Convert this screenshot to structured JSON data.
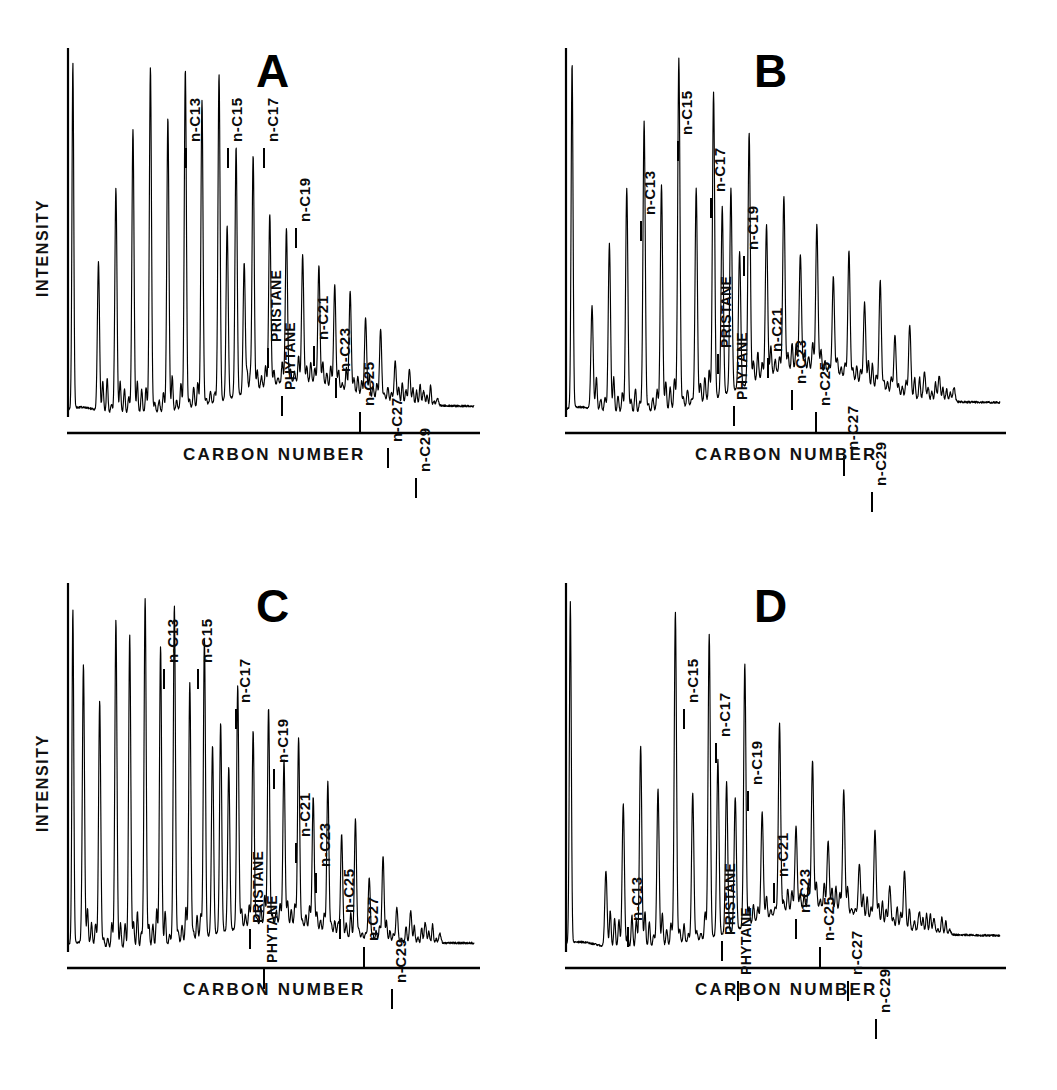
{
  "figure": {
    "axis_labels": {
      "x": "CARBON NUMBER",
      "y": "INTENSITY"
    },
    "ink_color": "#000000",
    "background_color": "#ffffff"
  },
  "panels": [
    {
      "id": "A",
      "letter": "A",
      "show_ylabel": true,
      "ylabel": "INTENSITY",
      "xlabel": "CARBON NUMBER",
      "labels": [
        {
          "text": "n-C13",
          "x": 118,
          "y": 32
        },
        {
          "text": "n-C15",
          "x": 160,
          "y": 32
        },
        {
          "text": "n-C17",
          "x": 196,
          "y": 32
        },
        {
          "text": "n-C19",
          "x": 228,
          "y": 112
        },
        {
          "text": "PRISTANE",
          "x": 200,
          "y": 232
        },
        {
          "text": "PHYTANE",
          "x": 214,
          "y": 280
        },
        {
          "text": "n-C21",
          "x": 246,
          "y": 230
        },
        {
          "text": "n-C23",
          "x": 268,
          "y": 262
        },
        {
          "text": "n-C25",
          "x": 292,
          "y": 296
        },
        {
          "text": "n-C27",
          "x": 320,
          "y": 332
        },
        {
          "text": "n-C29",
          "x": 348,
          "y": 362
        }
      ],
      "chart_data": {
        "type": "line",
        "title": "A",
        "xlabel": "CARBON NUMBER",
        "ylabel": "INTENSITY",
        "ylim": [
          0,
          100
        ],
        "ucm_hump": {
          "center": 0.56,
          "width": 0.3,
          "height": 7.5,
          "tail": 2.0
        },
        "solvent_peak": {
          "x": 0.012,
          "height": 96
        },
        "alkane_series": [
          {
            "name": "n-C10",
            "x": 0.075,
            "height": 42
          },
          {
            "name": "n-C11",
            "x": 0.118,
            "height": 62
          },
          {
            "name": "n-C12",
            "x": 0.16,
            "height": 78
          },
          {
            "name": "n-C13",
            "x": 0.203,
            "height": 95
          },
          {
            "name": "n-C14",
            "x": 0.246,
            "height": 81
          },
          {
            "name": "n-C15",
            "x": 0.289,
            "height": 94
          },
          {
            "name": "n-C16",
            "x": 0.33,
            "height": 86
          },
          {
            "name": "n-C17",
            "x": 0.372,
            "height": 93
          },
          {
            "name": "PRISTANE",
            "x": 0.392,
            "height": 52
          },
          {
            "name": "n-C18",
            "x": 0.414,
            "height": 73
          },
          {
            "name": "PHYTANE",
            "x": 0.434,
            "height": 42
          },
          {
            "name": "n-C19",
            "x": 0.456,
            "height": 71
          },
          {
            "name": "n-C20",
            "x": 0.497,
            "height": 55
          },
          {
            "name": "n-C21",
            "x": 0.538,
            "height": 51
          },
          {
            "name": "n-C22",
            "x": 0.578,
            "height": 44
          },
          {
            "name": "n-C23",
            "x": 0.618,
            "height": 41
          },
          {
            "name": "n-C24",
            "x": 0.657,
            "height": 36
          },
          {
            "name": "n-C25",
            "x": 0.695,
            "height": 34
          },
          {
            "name": "n-C26",
            "x": 0.733,
            "height": 27
          },
          {
            "name": "n-C27",
            "x": 0.77,
            "height": 24
          },
          {
            "name": "n-C28",
            "x": 0.806,
            "height": 15
          },
          {
            "name": "n-C29",
            "x": 0.841,
            "height": 13
          },
          {
            "name": "n-C30",
            "x": 0.876,
            "height": 7
          },
          {
            "name": "n-C31",
            "x": 0.91,
            "height": 5
          }
        ]
      }
    },
    {
      "id": "B",
      "letter": "B",
      "show_ylabel": false,
      "ylabel": "",
      "xlabel": "CARBON NUMBER",
      "labels": [
        {
          "text": "n-C13",
          "x": 75,
          "y": 105
        },
        {
          "text": "n-C15",
          "x": 112,
          "y": 25
        },
        {
          "text": "n-C17",
          "x": 145,
          "y": 82
        },
        {
          "text": "n-C19",
          "x": 178,
          "y": 140
        },
        {
          "text": "PRISTANE",
          "x": 152,
          "y": 238
        },
        {
          "text": "PHYTANE",
          "x": 168,
          "y": 290
        },
        {
          "text": "n-C21",
          "x": 202,
          "y": 242
        },
        {
          "text": "n-C23",
          "x": 226,
          "y": 274
        },
        {
          "text": "n-C25",
          "x": 250,
          "y": 296
        },
        {
          "text": "n-C27",
          "x": 278,
          "y": 340
        },
        {
          "text": "n-C29",
          "x": 306,
          "y": 376
        }
      ],
      "chart_data": {
        "type": "line",
        "title": "B",
        "xlabel": "CARBON NUMBER",
        "ylabel": "INTENSITY",
        "ylim": [
          0,
          100
        ],
        "ucm_hump": {
          "center": 0.54,
          "width": 0.3,
          "height": 10.5,
          "tail": 3.0
        },
        "solvent_peak": {
          "x": 0.014,
          "height": 96
        },
        "alkane_series": [
          {
            "name": "n-C10",
            "x": 0.06,
            "height": 30
          },
          {
            "name": "n-C11",
            "x": 0.1,
            "height": 47
          },
          {
            "name": "n-C12",
            "x": 0.14,
            "height": 62
          },
          {
            "name": "n-C13",
            "x": 0.18,
            "height": 80
          },
          {
            "name": "n-C14",
            "x": 0.22,
            "height": 63
          },
          {
            "name": "n-C15",
            "x": 0.26,
            "height": 97
          },
          {
            "name": "n-C16",
            "x": 0.3,
            "height": 62
          },
          {
            "name": "n-C17",
            "x": 0.34,
            "height": 88
          },
          {
            "name": "PRISTANE",
            "x": 0.36,
            "height": 57
          },
          {
            "name": "n-C18",
            "x": 0.38,
            "height": 62
          },
          {
            "name": "PHYTANE",
            "x": 0.4,
            "height": 45
          },
          {
            "name": "n-C19",
            "x": 0.422,
            "height": 77
          },
          {
            "name": "n-C20",
            "x": 0.462,
            "height": 52
          },
          {
            "name": "n-C21",
            "x": 0.502,
            "height": 60
          },
          {
            "name": "n-C22",
            "x": 0.54,
            "height": 44
          },
          {
            "name": "n-C23",
            "x": 0.578,
            "height": 52
          },
          {
            "name": "n-C24",
            "x": 0.616,
            "height": 38
          },
          {
            "name": "n-C25",
            "x": 0.652,
            "height": 45
          },
          {
            "name": "n-C26",
            "x": 0.688,
            "height": 31
          },
          {
            "name": "n-C27",
            "x": 0.724,
            "height": 37
          },
          {
            "name": "n-C28",
            "x": 0.758,
            "height": 22
          },
          {
            "name": "n-C29",
            "x": 0.792,
            "height": 25
          },
          {
            "name": "n-C30",
            "x": 0.826,
            "height": 12
          },
          {
            "name": "n-C31",
            "x": 0.86,
            "height": 11
          },
          {
            "name": "n-C32",
            "x": 0.894,
            "height": 8
          }
        ]
      }
    },
    {
      "id": "C",
      "letter": "C",
      "show_ylabel": true,
      "ylabel": "INTENSITY",
      "xlabel": "CARBON NUMBER",
      "labels": [
        {
          "text": "n-C13",
          "x": 96,
          "y": 18
        },
        {
          "text": "n-C15",
          "x": 130,
          "y": 18
        },
        {
          "text": "n-C17",
          "x": 168,
          "y": 58
        },
        {
          "text": "n-C19",
          "x": 206,
          "y": 118
        },
        {
          "text": "PRISTANE",
          "x": 182,
          "y": 278
        },
        {
          "text": "PHYTANE",
          "x": 196,
          "y": 318
        },
        {
          "text": "n-C21",
          "x": 228,
          "y": 192
        },
        {
          "text": "n-C23",
          "x": 248,
          "y": 222
        },
        {
          "text": "n-C25",
          "x": 272,
          "y": 268
        },
        {
          "text": "n-C27",
          "x": 296,
          "y": 296
        },
        {
          "text": "n-C29",
          "x": 324,
          "y": 338
        }
      ],
      "chart_data": {
        "type": "line",
        "title": "C",
        "xlabel": "CARBON NUMBER",
        "ylabel": "INTENSITY",
        "ylim": [
          0,
          100
        ],
        "ucm_hump": {
          "center": 0.5,
          "width": 0.3,
          "height": 6.0,
          "tail": 1.5
        },
        "solvent_peak": {
          "x": 0.012,
          "height": 93
        },
        "alkane_series": [
          {
            "name": "n-C9",
            "x": 0.038,
            "height": 78
          },
          {
            "name": "n-C10",
            "x": 0.078,
            "height": 68
          },
          {
            "name": "n-C11",
            "x": 0.118,
            "height": 90
          },
          {
            "name": "n-C12",
            "x": 0.152,
            "height": 86
          },
          {
            "name": "n-C13",
            "x": 0.19,
            "height": 96
          },
          {
            "name": "n-C14",
            "x": 0.228,
            "height": 83
          },
          {
            "name": "n-C15",
            "x": 0.262,
            "height": 94
          },
          {
            "name": "n-C16",
            "x": 0.3,
            "height": 73
          },
          {
            "name": "n-C17",
            "x": 0.336,
            "height": 85
          },
          {
            "name": "PRISTANE",
            "x": 0.356,
            "height": 56
          },
          {
            "name": "n-C18",
            "x": 0.376,
            "height": 62
          },
          {
            "name": "PHYTANE",
            "x": 0.396,
            "height": 50
          },
          {
            "name": "n-C19",
            "x": 0.418,
            "height": 72
          },
          {
            "name": "n-C20",
            "x": 0.456,
            "height": 60
          },
          {
            "name": "n-C21",
            "x": 0.494,
            "height": 66
          },
          {
            "name": "n-C22",
            "x": 0.532,
            "height": 52
          },
          {
            "name": "n-C23",
            "x": 0.568,
            "height": 58
          },
          {
            "name": "n-C24",
            "x": 0.604,
            "height": 42
          },
          {
            "name": "n-C25",
            "x": 0.64,
            "height": 46
          },
          {
            "name": "n-C26",
            "x": 0.674,
            "height": 32
          },
          {
            "name": "n-C27",
            "x": 0.708,
            "height": 36
          },
          {
            "name": "n-C28",
            "x": 0.742,
            "height": 20
          },
          {
            "name": "n-C29",
            "x": 0.776,
            "height": 26
          },
          {
            "name": "n-C30",
            "x": 0.81,
            "height": 12
          },
          {
            "name": "n-C31",
            "x": 0.844,
            "height": 11
          },
          {
            "name": "n-C32",
            "x": 0.88,
            "height": 8
          },
          {
            "name": "n-C33",
            "x": 0.916,
            "height": 5
          }
        ]
      }
    },
    {
      "id": "D",
      "letter": "D",
      "show_ylabel": false,
      "ylabel": "",
      "xlabel": "CARBON NUMBER",
      "labels": [
        {
          "text": "n-C13",
          "x": 62,
          "y": 276
        },
        {
          "text": "n-C15",
          "x": 118,
          "y": 58
        },
        {
          "text": "n-C17",
          "x": 150,
          "y": 92
        },
        {
          "text": "n-C19",
          "x": 182,
          "y": 140
        },
        {
          "text": "PRISTANE",
          "x": 156,
          "y": 290
        },
        {
          "text": "PHYTANE",
          "x": 172,
          "y": 330
        },
        {
          "text": "n-C21",
          "x": 208,
          "y": 232
        },
        {
          "text": "n-C23",
          "x": 230,
          "y": 268
        },
        {
          "text": "n-C25",
          "x": 254,
          "y": 296
        },
        {
          "text": "n-C27",
          "x": 282,
          "y": 330
        },
        {
          "text": "n-C29",
          "x": 310,
          "y": 368
        }
      ],
      "chart_data": {
        "type": "line",
        "title": "D",
        "xlabel": "CARBON NUMBER",
        "ylabel": "INTENSITY",
        "ylim": [
          0,
          100
        ],
        "ucm_hump": {
          "center": 0.56,
          "width": 0.3,
          "height": 9.0,
          "tail": 3.5
        },
        "solvent_peak": {
          "x": 0.01,
          "height": 95
        },
        "alkane_series": [
          {
            "name": "n-C11",
            "x": 0.092,
            "height": 22
          },
          {
            "name": "n-C12",
            "x": 0.132,
            "height": 40
          },
          {
            "name": "n-C13",
            "x": 0.172,
            "height": 56
          },
          {
            "name": "n-C14",
            "x": 0.212,
            "height": 44
          },
          {
            "name": "n-C15",
            "x": 0.252,
            "height": 92
          },
          {
            "name": "n-C16",
            "x": 0.292,
            "height": 43
          },
          {
            "name": "n-C17",
            "x": 0.33,
            "height": 86
          },
          {
            "name": "PRISTANE",
            "x": 0.35,
            "height": 52
          },
          {
            "name": "n-C18",
            "x": 0.37,
            "height": 46
          },
          {
            "name": "PHYTANE",
            "x": 0.39,
            "height": 42
          },
          {
            "name": "n-C19",
            "x": 0.412,
            "height": 78
          },
          {
            "name": "n-C20",
            "x": 0.452,
            "height": 38
          },
          {
            "name": "n-C21",
            "x": 0.492,
            "height": 62
          },
          {
            "name": "n-C22",
            "x": 0.53,
            "height": 34
          },
          {
            "name": "n-C23",
            "x": 0.568,
            "height": 52
          },
          {
            "name": "n-C24",
            "x": 0.604,
            "height": 30
          },
          {
            "name": "n-C25",
            "x": 0.64,
            "height": 44
          },
          {
            "name": "n-C26",
            "x": 0.676,
            "height": 24
          },
          {
            "name": "n-C27",
            "x": 0.712,
            "height": 33
          },
          {
            "name": "n-C28",
            "x": 0.746,
            "height": 18
          },
          {
            "name": "n-C29",
            "x": 0.78,
            "height": 22
          },
          {
            "name": "n-C30",
            "x": 0.814,
            "height": 11
          },
          {
            "name": "n-C31",
            "x": 0.848,
            "height": 9
          },
          {
            "name": "n-C32",
            "x": 0.884,
            "height": 6
          }
        ]
      }
    }
  ],
  "layout": {
    "panel_geometry": [
      {
        "id": "A",
        "left": 20,
        "top": 20,
        "plot_w": 462,
        "plot_h": 455,
        "axis_x": 48,
        "axis_y_top": 28
      },
      {
        "id": "B",
        "left": 546,
        "top": 20,
        "plot_w": 462,
        "plot_h": 455,
        "axis_x": 20,
        "axis_y_top": 28
      },
      {
        "id": "C",
        "left": 20,
        "top": 555,
        "plot_w": 462,
        "plot_h": 455,
        "axis_x": 48,
        "axis_y_top": 28
      },
      {
        "id": "D",
        "left": 546,
        "top": 555,
        "plot_w": 462,
        "plot_h": 455,
        "axis_x": 20,
        "axis_y_top": 28
      }
    ]
  }
}
